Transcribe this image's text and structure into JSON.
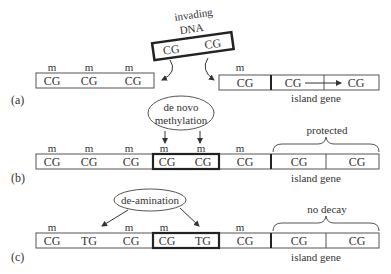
{
  "panels": {
    "a": {
      "label": "(a)",
      "invading_dna": {
        "title_line1": "invading",
        "title_line2": "DNA",
        "sites": [
          "CG",
          "CG"
        ]
      },
      "left_strand": {
        "marks": [
          "m",
          "m",
          "m"
        ],
        "sites": [
          "CG",
          "CG",
          "CG"
        ]
      },
      "right_strand": {
        "marks": [
          "m"
        ],
        "sites": [
          "CG",
          "CG",
          "CG"
        ],
        "gene_label": "island gene"
      }
    },
    "b": {
      "label": "(b)",
      "process": {
        "line1": "de novo",
        "line2": "methylation"
      },
      "marks": [
        "m",
        "m",
        "m",
        "m",
        "m",
        "m"
      ],
      "sites": [
        "CG",
        "CG",
        "CG",
        "CG",
        "CG",
        "CG",
        "CG",
        "CG"
      ],
      "brace_label": "protected",
      "gene_label": "island gene"
    },
    "c": {
      "label": "(c)",
      "process": "de-amination",
      "marks": [
        "m",
        "m",
        "m",
        "m"
      ],
      "sites": [
        "CG",
        "TG",
        "CG",
        "CG",
        "TG",
        "CG",
        "CG",
        "CG"
      ],
      "brace_label": "no decay",
      "gene_label": "island gene"
    }
  },
  "colors": {
    "ink": "#333333",
    "box": "#555555",
    "thick": "#222222"
  }
}
